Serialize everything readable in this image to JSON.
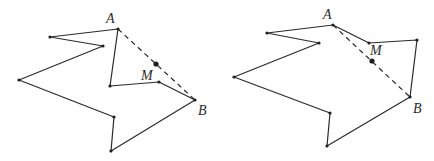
{
  "figures": [
    {
      "id": "left",
      "description": "Non-convex polygon where midpoint M of diagonal AB lies outside the polygon",
      "vertices": [
        [
          118,
          29
        ],
        [
          50,
          37
        ],
        [
          103,
          46
        ],
        [
          19,
          80
        ],
        [
          114,
          117
        ],
        [
          111,
          151
        ],
        [
          195,
          100
        ],
        [
          159,
          82
        ],
        [
          110,
          86
        ]
      ],
      "diagonal": {
        "from": [
          118,
          29
        ],
        "to": [
          195,
          100
        ]
      },
      "midpoint": [
        156,
        64
      ],
      "labels": {
        "A": {
          "text": "A",
          "x": 106,
          "y": 23
        },
        "B": {
          "text": "B",
          "x": 198,
          "y": 115
        },
        "M": {
          "text": "M",
          "x": 141,
          "y": 80
        }
      }
    },
    {
      "id": "right",
      "description": "Non-convex polygon where midpoint M of diagonal AB lies inside the polygon",
      "vertices": [
        [
          333,
          25
        ],
        [
          267,
          33
        ],
        [
          319,
          43
        ],
        [
          234,
          77
        ],
        [
          330,
          113
        ],
        [
          327,
          146
        ],
        [
          410,
          97
        ],
        [
          417,
          40
        ],
        [
          369,
          43
        ]
      ],
      "diagonal": {
        "from": [
          333,
          25
        ],
        "to": [
          410,
          97
        ]
      },
      "midpoint": [
        372,
        61
      ],
      "labels": {
        "A": {
          "text": "A",
          "x": 323,
          "y": 19
        },
        "B": {
          "text": "B",
          "x": 413,
          "y": 113
        },
        "M": {
          "text": "M",
          "x": 370,
          "y": 55
        }
      }
    }
  ],
  "colors": {
    "stroke": "#2a2a2a",
    "point": "#1e1e1e",
    "background": "#ffffff"
  }
}
